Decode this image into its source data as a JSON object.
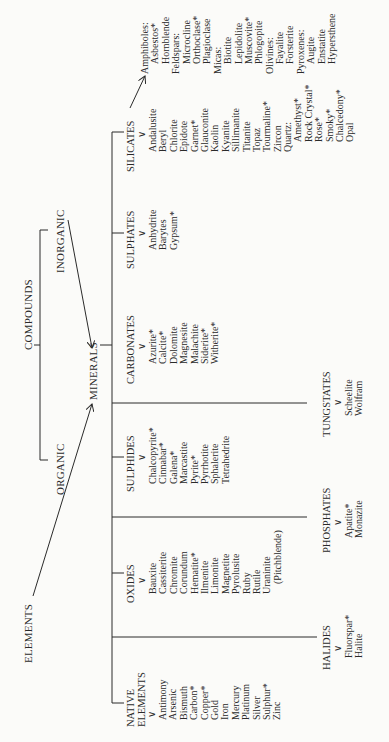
{
  "top": {
    "elements": "ELEMENTS",
    "compounds": "COMPOUNDS",
    "organic": "ORGANIC",
    "inorganic": "INORGANIC",
    "minerals": "MINERALS"
  },
  "categories": {
    "native": {
      "label_1": "NATIVE",
      "label_2": "ELEMENTS",
      "items": [
        "Antimony",
        "Arsenic",
        "Bismuth",
        "Carbon*",
        "Copper*",
        "Gold",
        "Iron",
        "Mercury",
        "Platinum",
        "Silver",
        "Sulphur*",
        "Zinc"
      ]
    },
    "oxides": {
      "label": "OXIDES",
      "items": [
        "Bauxite",
        "Cassiterite",
        "Chromite",
        "Corundum",
        "Hematite*",
        "Ilmenite",
        "Limonite",
        "Magnetite",
        "Pyrolusite",
        "Ruby",
        "Rutile",
        "Uraninite",
        "(Pitchblende)"
      ]
    },
    "sulphides": {
      "label": "SULPHIDES",
      "items": [
        "Chalcopyrite*",
        "Cinnabar*",
        "Galena*",
        "Marcastite",
        "Pyrite*",
        "Pyrrhotite",
        "Sphalerite",
        "Tetrahedrite"
      ]
    },
    "carbonates": {
      "label": "CARBONATES",
      "items": [
        "Azurite*",
        "Calcite*",
        "Dolomite",
        "Magnesite",
        "Malachite",
        "Siderite*",
        "Witherite*"
      ]
    },
    "sulphates": {
      "label": "SULPHATES",
      "items": [
        "Anhydrite",
        "Barytes",
        "Gypsum*"
      ]
    },
    "silicates": {
      "label": "SILICATES",
      "items": [
        "Andalusite",
        "Beryl",
        "Chlorite",
        "Epidote",
        "Garnet*",
        "Glauconite",
        "Kaolin",
        "Kyanite",
        "Sillimanite",
        "Titanite",
        "Topaz",
        "Tourmaline*",
        "Zircon",
        "Quartz:",
        "Amethyst*",
        "Rock Crystal*",
        "Rose*",
        "Smoky*",
        "Chalcedony*",
        "Opal"
      ],
      "groups": [
        "Amphiboles:",
        "Asbestos*",
        "Hornblende",
        "Feldspars:",
        "Microcline",
        "Orthoclase*",
        "Plagioclase",
        "Micas:",
        "Biotite",
        "Lepidolite",
        "Muscovite*",
        "Phlogopite",
        "Olivines:",
        "Fayalite",
        "Forsterite",
        "Pyroxenes:",
        "Augite",
        "Enstatite",
        "Hypersthene"
      ]
    },
    "halides": {
      "label": "HALIDES",
      "items": [
        "Fluorspar*",
        "Halite"
      ]
    },
    "phosphates": {
      "label": "PHOSPHATES",
      "items": [
        "Apatite*",
        "Monazite"
      ]
    },
    "tungstates": {
      "label": "TUNGSTATES",
      "items": [
        "Scheelite",
        "Wolfram"
      ]
    }
  },
  "icons": {
    "down_arrow": "∨"
  }
}
